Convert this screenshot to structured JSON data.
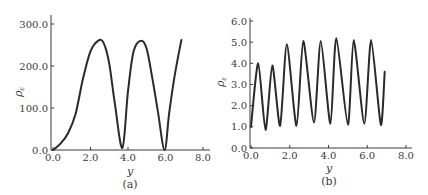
{
  "chart_data": [
    {
      "type": "line",
      "panel": "a",
      "caption": "(a)",
      "xlabel": "y",
      "ylabel": "ρε",
      "xlim": [
        0,
        8
      ],
      "ylim": [
        0,
        300
      ],
      "x_ticks": [
        "0.0",
        "2.0",
        "4.0",
        "6.0",
        "8.0"
      ],
      "y_ticks": [
        "0.0",
        "100.0",
        "200.0",
        "300.0"
      ],
      "grid": false,
      "series": [
        {
          "name": "ρε",
          "x": [
            0.0,
            0.4,
            0.8,
            1.2,
            1.6,
            2.0,
            2.4,
            2.7,
            3.0,
            3.3,
            3.7,
            4.0,
            4.3,
            4.7,
            5.0,
            5.3,
            5.6,
            5.95,
            6.2,
            6.5,
            6.85
          ],
          "y": [
            0,
            15,
            40,
            85,
            170,
            235,
            260,
            255,
            205,
            110,
            5,
            140,
            235,
            260,
            240,
            170,
            90,
            0,
            90,
            180,
            262
          ]
        }
      ]
    },
    {
      "type": "line",
      "panel": "b",
      "caption": "(b)",
      "xlabel": "y",
      "ylabel": "ρε",
      "xlim": [
        0,
        8
      ],
      "ylim": [
        0,
        6
      ],
      "x_ticks": [
        "0.0",
        "2.0",
        "4.0",
        "6.0",
        "8.0"
      ],
      "y_ticks": [
        "0.0",
        "1.0",
        "2.0",
        "3.0",
        "4.0",
        "5.0",
        "6.0"
      ],
      "grid": false,
      "series": [
        {
          "name": "ρε",
          "x": [
            0.0,
            0.37,
            0.75,
            1.1,
            1.5,
            1.85,
            2.35,
            2.7,
            3.25,
            3.6,
            4.1,
            4.4,
            5.0,
            5.3,
            5.85,
            6.2,
            6.7,
            6.9
          ],
          "y": [
            1.0,
            4.0,
            0.85,
            3.9,
            1.05,
            4.9,
            1.05,
            5.05,
            1.2,
            5.05,
            1.15,
            5.2,
            1.1,
            5.1,
            1.15,
            5.1,
            1.1,
            3.6
          ]
        }
      ]
    }
  ]
}
